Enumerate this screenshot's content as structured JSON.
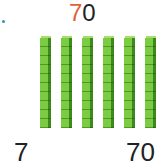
{
  "title": {
    "tens_digit": "7",
    "ones_digit": "0"
  },
  "rods": {
    "count": 7,
    "cubes_per_rod": 10,
    "color": "#7ccc43"
  },
  "labels": {
    "left": "7",
    "right": "70"
  },
  "colors": {
    "tens_digit": "#e0603a",
    "text": "#222222"
  }
}
